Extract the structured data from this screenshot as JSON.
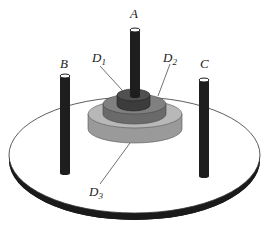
{
  "diagram": {
    "type": "tower-of-hanoi",
    "pegs": [
      {
        "id": "A",
        "label": "A"
      },
      {
        "id": "B",
        "label": "B"
      },
      {
        "id": "C",
        "label": "C"
      }
    ],
    "disks": [
      {
        "id": "D1",
        "letter": "D",
        "index": "1",
        "peg": "A",
        "color": "#4a4a4a"
      },
      {
        "id": "D2",
        "letter": "D",
        "index": "2",
        "peg": "A",
        "color": "#7a7a7a"
      },
      {
        "id": "D3",
        "letter": "D",
        "index": "3",
        "peg": "A",
        "color": "#b4b4b4"
      }
    ],
    "colors": {
      "peg": "#1e1e1e",
      "base_top": "#ffffff",
      "base_rim": "#1a1a1a",
      "outline": "#222222"
    }
  }
}
